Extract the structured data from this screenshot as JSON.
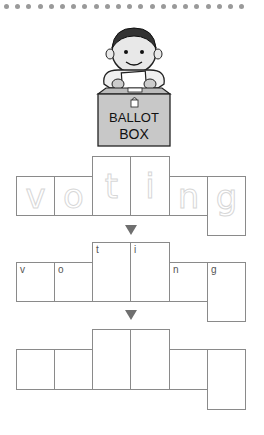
{
  "worksheet": {
    "word": "voting",
    "letters": [
      "v",
      "o",
      "t",
      "i",
      "n",
      "g"
    ],
    "illustration": {
      "label_line1": "BALLOT",
      "label_line2": "BOX"
    },
    "rows": [
      {
        "name": "trace-row",
        "letters": [
          "v",
          "o",
          "t",
          "i",
          "n",
          "g"
        ],
        "style": "dotted-trace"
      },
      {
        "name": "guide-row",
        "letters": [
          "v",
          "o",
          "t",
          "i",
          "n",
          "g"
        ],
        "style": "small-corner-letters"
      },
      {
        "name": "blank-row",
        "letters": [
          "",
          "",
          "",
          "",
          "",
          ""
        ],
        "style": "empty"
      }
    ],
    "colors": {
      "border": "#8a8a8a",
      "arrow": "#6f6f6f",
      "dots": "#9a9a9a"
    }
  }
}
